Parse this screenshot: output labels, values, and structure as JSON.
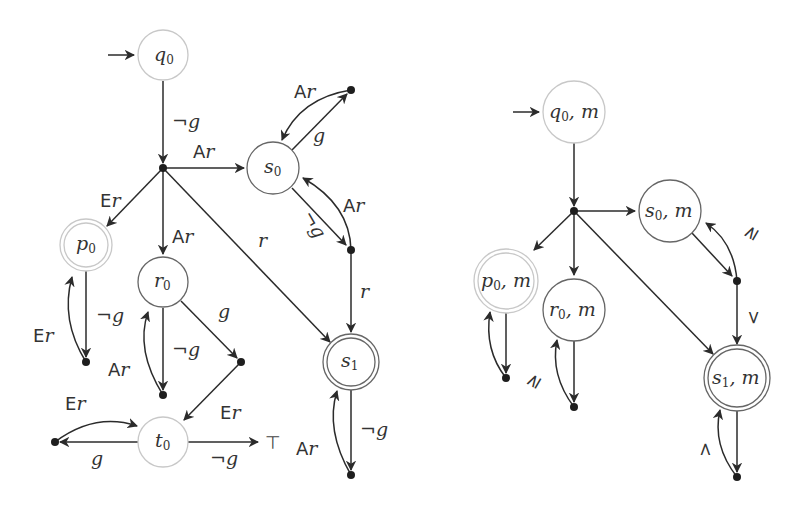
{
  "diagram": {
    "left_automaton": {
      "nodes": {
        "q0": {
          "name": "q",
          "sub": "0"
        },
        "s0": {
          "name": "s",
          "sub": "0"
        },
        "p0": {
          "name": "p",
          "sub": "0"
        },
        "r0": {
          "name": "r",
          "sub": "0"
        },
        "s1": {
          "name": "s",
          "sub": "1"
        },
        "t0": {
          "name": "t",
          "sub": "0"
        }
      },
      "edge_labels": {
        "q0_hub": "¬g",
        "hub_s0_A": "A",
        "hub_s0_r": "r",
        "hub_p0_E": "E",
        "hub_p0_r": "r",
        "hub_r0_A": "A",
        "hub_r0_r": "r",
        "hub_s1": "r",
        "s0_top_A": "A",
        "s0_top_r": "r",
        "s0_top_g": "g",
        "s0_right_neg": "¬g",
        "s0_right_A": "A",
        "s0_right_r": "r",
        "right_s1": "r",
        "p0_dot": "¬g",
        "p0_back_E": "E",
        "p0_back_r": "r",
        "r0_dot": "¬g",
        "r0_back_A": "A",
        "r0_back_r": "r",
        "r0_g": "g",
        "gdot_t0_E": "E",
        "gdot_t0_r": "r",
        "t0_left_g": "g",
        "t0_left_back_E": "E",
        "t0_left_back_r": "r",
        "t0_top": "¬g",
        "top_symbol": "⊤",
        "s1_dot": "¬g",
        "s1_back_A": "A",
        "s1_back_r": "r"
      }
    },
    "right_automaton": {
      "nodes": {
        "q0m": {
          "name": "q",
          "sub": "0",
          "suffix": ", m"
        },
        "s0m": {
          "name": "s",
          "sub": "0",
          "suffix": ", m"
        },
        "p0m": {
          "name": "p",
          "sub": "0",
          "suffix": ", m"
        },
        "r0m": {
          "name": "r",
          "sub": "0",
          "suffix": ", m"
        },
        "s1m": {
          "name": "s",
          "sub": "1",
          "suffix": ", m"
        }
      },
      "edge_labels": {
        "s0m_back": "≥",
        "r0m_back": "≥",
        "right_s1m": ">",
        "s1m_back": ">"
      }
    }
  }
}
